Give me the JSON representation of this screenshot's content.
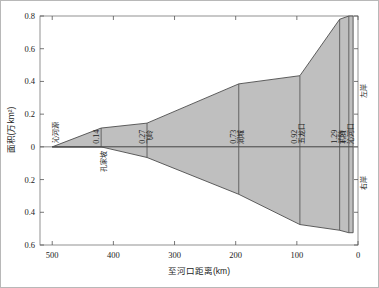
{
  "axes": {
    "x": {
      "title": "至河口距离(km)",
      "ticks": [
        "500",
        "400",
        "300",
        "200",
        "100",
        "0"
      ],
      "values": [
        500,
        400,
        300,
        200,
        100,
        0
      ],
      "min": 0,
      "max": 520,
      "reversed": true
    },
    "y": {
      "title": "面积(万km²)",
      "ticks": [
        "0.8",
        "0.6",
        "0.4",
        "0.2",
        "0",
        "0.2",
        "0.4",
        "0.6"
      ],
      "values": [
        0.8,
        0.6,
        0.4,
        0.2,
        0,
        -0.2,
        -0.4,
        -0.6
      ],
      "min": -0.6,
      "max": 0.8
    }
  },
  "bank_labels": {
    "left": "左岸",
    "right": "右岸"
  },
  "stations": [
    {
      "name": "沁河源",
      "distance": 500,
      "value": null,
      "value_label": ""
    },
    {
      "name": "孔家坡",
      "distance": 420,
      "value": 0.14,
      "value_label": "0.14"
    },
    {
      "name": "飞岭",
      "distance": 345,
      "value": 0.27,
      "value_label": "0.27"
    },
    {
      "name": "润城",
      "distance": 195,
      "value": 0.73,
      "value_label": "0.73"
    },
    {
      "name": "五龙口",
      "distance": 95,
      "value": 0.92,
      "value_label": "0.92"
    },
    {
      "name": "武陟",
      "distance": 30,
      "value": 1.29,
      "value_label": "1.29"
    },
    {
      "name": "沁河口",
      "distance": 15,
      "value": 1.31,
      "value_label": "1.31"
    }
  ],
  "colors": {
    "fill": "#bfbfbf",
    "stroke": "#4d4d4d",
    "axis": "#555555",
    "text": "#222222",
    "frame": "#888888"
  },
  "chart_data": {
    "type": "area",
    "title": "",
    "subtitle": "",
    "xlabel": "至河口距离(km)",
    "ylabel": "面积(万km²)",
    "xlim": [
      520,
      0
    ],
    "ylim": [
      -0.6,
      0.8
    ],
    "grid": false,
    "legend": "none",
    "x_reversed": true,
    "annotations": [
      {
        "text": "沁河源",
        "x": 500,
        "y": 0.12,
        "orientation": "vertical"
      },
      {
        "text": "左岸",
        "x": 2,
        "y": 0.28,
        "orientation": "vertical"
      },
      {
        "text": "右岸",
        "x": 2,
        "y": -0.22,
        "orientation": "vertical"
      }
    ],
    "series": [
      {
        "name": "左岸累计面积",
        "type": "area",
        "side": "upper",
        "x": [
          500,
          420,
          345,
          195,
          95,
          30,
          15,
          8
        ],
        "values": [
          0.0,
          0.115,
          0.145,
          0.385,
          0.435,
          0.78,
          0.8,
          0.8
        ]
      },
      {
        "name": "右岸累计面积",
        "type": "area",
        "side": "lower",
        "x": [
          500,
          420,
          345,
          195,
          95,
          30,
          15,
          8
        ],
        "values": [
          0.0,
          0.0,
          -0.065,
          -0.29,
          -0.475,
          -0.51,
          -0.525,
          -0.525
        ]
      }
    ],
    "station_markers": {
      "categories": [
        "沁河源",
        "孔家坡",
        "飞岭",
        "润城",
        "五龙口",
        "武陟",
        "沁河口"
      ],
      "x": [
        500,
        420,
        345,
        195,
        95,
        30,
        15
      ],
      "cumulative_area": [
        null,
        0.14,
        0.27,
        0.73,
        0.92,
        1.29,
        1.31
      ]
    }
  }
}
